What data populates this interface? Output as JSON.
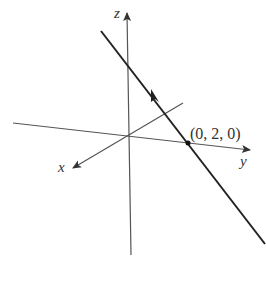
{
  "diagram": {
    "type": "3d-coordinate-axes-with-line",
    "axes": {
      "x": {
        "label": "x"
      },
      "y": {
        "label": "y"
      },
      "z": {
        "label": "z"
      }
    },
    "point": {
      "label": "(0, 2, 0)"
    },
    "line": {
      "direction_arrow": "up-left"
    },
    "colors": {
      "axis": "#555555",
      "line": "#222222",
      "text": "#333333"
    }
  }
}
